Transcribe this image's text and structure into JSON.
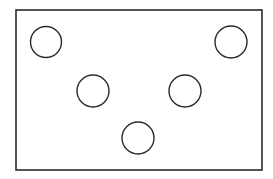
{
  "diagram": {
    "background": "#ffffff",
    "stroke_color": "#2a2a2a",
    "frame": {
      "x": 16,
      "y": 10,
      "width": 246,
      "height": 160,
      "stroke_width": 1.6
    },
    "circles": [
      {
        "id": "top-left",
        "cx": 46,
        "cy": 42,
        "r": 15.5
      },
      {
        "id": "top-right",
        "cx": 231,
        "cy": 42,
        "r": 16
      },
      {
        "id": "middle-left",
        "cx": 93,
        "cy": 91,
        "r": 16
      },
      {
        "id": "middle-right",
        "cx": 185,
        "cy": 91,
        "r": 16
      },
      {
        "id": "bottom-center",
        "cx": 138,
        "cy": 138,
        "r": 16
      }
    ],
    "circle_stroke_width": 1.4
  }
}
